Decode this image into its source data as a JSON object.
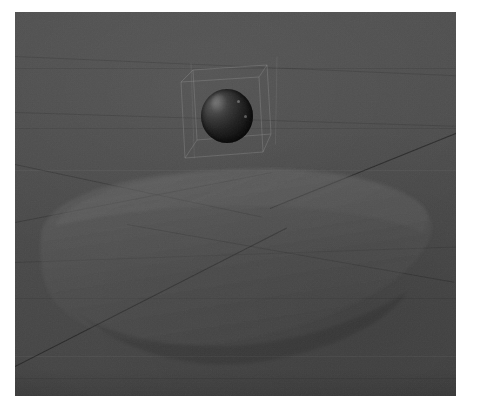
{
  "scene": {
    "title": "3D viewport render",
    "background_color": "#4a4a4a",
    "page_background": "#ffffff",
    "viewport": {
      "x": 15,
      "y": 12,
      "width": 441,
      "height": 384
    }
  },
  "objects": [
    {
      "name": "sphere",
      "label": "Sphere",
      "shading": "dark glossy",
      "base_color": "#1a1a1a",
      "highlight_color": "#5e5e5e",
      "center": [
        212,
        103
      ],
      "radius": 26,
      "selected": true
    },
    {
      "name": "slab",
      "label": "Rounded slab",
      "material": "translucent",
      "fill_color": "#5a5a5a",
      "opacity": 0.38,
      "corner_radius": 58
    },
    {
      "name": "ground-plane",
      "label": "Ground plane",
      "fill_color": "#4a4a4a"
    }
  ],
  "selection": {
    "active_object": "sphere",
    "outline_color": "#9a9a9a",
    "visible": true
  },
  "grid": {
    "visible": true,
    "line_color": "#1c1c1c",
    "faint_line_color": "#3a3a3a",
    "perspective": true
  },
  "gridlines": [
    {
      "name": "major-diagonal-right",
      "x": 255,
      "y": 196,
      "length": 260,
      "angle": -22
    },
    {
      "name": "major-diagonal-left",
      "x": 2,
      "y": 352,
      "length": 300,
      "angle": -27
    },
    {
      "name": "mid-diagonal-cross-a",
      "x": 2,
      "y": 152,
      "length": 250,
      "angle": 12
    },
    {
      "name": "mid-diagonal-cross-b",
      "x": 2,
      "y": 208,
      "length": 260,
      "angle": -11
    },
    {
      "name": "slab-crossing-line",
      "x": 112,
      "y": 212,
      "length": 330,
      "angle": 10
    },
    {
      "name": "upper-hair-a",
      "x": 0,
      "y": 58,
      "length": 441,
      "angle": 3
    },
    {
      "name": "upper-hair-b",
      "x": 0,
      "y": 118,
      "length": 441,
      "angle": 2
    },
    {
      "name": "pale-vertical-left",
      "x": 172,
      "y": 62,
      "length": 130,
      "angle": 88
    },
    {
      "name": "pale-vertical-right",
      "x": 262,
      "y": 56,
      "length": 120,
      "angle": 91
    }
  ],
  "slab_outline": {
    "points": "26,224 42,206 72,190 118,176 168,166 236,160 300,162 352,172 392,190 412,212 408,242 386,272 340,300 282,322 222,334 164,334 112,324 70,304 40,276 26,248"
  },
  "selection_box": {
    "front": "166,72 252,64 258,136 172,144",
    "back": "180,60 258,56 262,124 180,130"
  },
  "viewport_overlay": {
    "statusbar_visible": false,
    "axis_gizmo_visible": false
  }
}
